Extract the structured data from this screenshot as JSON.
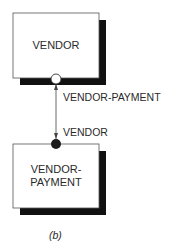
{
  "diagram": {
    "entities": [
      {
        "id": "vendor",
        "label": "VENDOR"
      },
      {
        "id": "vendor-payment",
        "label_line1": "VENDOR-",
        "label_line2": "PAYMENT"
      }
    ],
    "relationship": {
      "from": "vendor",
      "to": "vendor-payment",
      "end_labels": {
        "at_vendor": "VENDOR-PAYMENT",
        "at_vendor_payment": "VENDOR"
      },
      "markers": {
        "vendor_end": "open-circle",
        "vendor_payment_end": "filled-circle"
      }
    },
    "caption": "(b)"
  }
}
